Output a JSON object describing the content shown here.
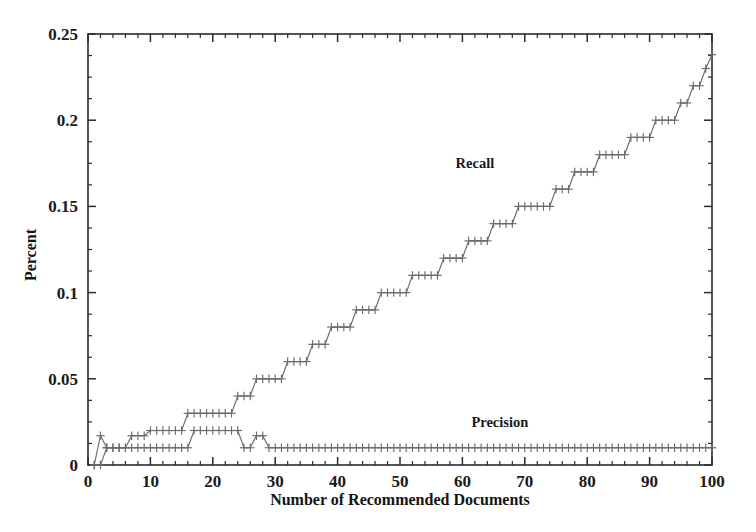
{
  "chart_data": {
    "type": "line",
    "title": "",
    "xlabel": "Number of Recommended Documents",
    "ylabel": "Percent",
    "xlim": [
      0,
      100
    ],
    "ylim": [
      0,
      0.25
    ],
    "xticks": [
      0,
      10,
      20,
      30,
      40,
      50,
      60,
      70,
      80,
      90,
      100
    ],
    "xticklabels": [
      "0",
      "10",
      "20",
      "30",
      "40",
      "50",
      "60",
      "70",
      "80",
      "90",
      "100"
    ],
    "yticks": [
      0,
      0.05,
      0.1,
      0.15,
      0.2,
      0.25
    ],
    "yticklabels": [
      "0",
      "0.05",
      "0.1",
      "0.15",
      "0.2",
      "0.25"
    ],
    "grid": false,
    "legend_position": "inline-annotations",
    "marker": "plus",
    "line_color": "#6a6a6a",
    "series": [
      {
        "name": "Recall",
        "label_x": 62,
        "label_y": 0.172,
        "x": [
          1,
          2,
          3,
          4,
          5,
          6,
          7,
          8,
          9,
          10,
          11,
          12,
          13,
          14,
          15,
          16,
          17,
          18,
          19,
          20,
          21,
          22,
          23,
          24,
          25,
          26,
          27,
          28,
          29,
          30,
          31,
          32,
          33,
          34,
          35,
          36,
          37,
          38,
          39,
          40,
          41,
          42,
          43,
          44,
          45,
          46,
          47,
          48,
          49,
          50,
          51,
          52,
          53,
          54,
          55,
          56,
          57,
          58,
          59,
          60,
          61,
          62,
          63,
          64,
          65,
          66,
          67,
          68,
          69,
          70,
          71,
          72,
          73,
          74,
          75,
          76,
          77,
          78,
          79,
          80,
          81,
          82,
          83,
          84,
          85,
          86,
          87,
          88,
          89,
          90,
          91,
          92,
          93,
          94,
          95,
          96,
          97,
          98,
          99,
          100
        ],
        "y": [
          0.0,
          0.017,
          0.01,
          0.01,
          0.01,
          0.01,
          0.017,
          0.017,
          0.017,
          0.02,
          0.02,
          0.02,
          0.02,
          0.02,
          0.02,
          0.03,
          0.03,
          0.03,
          0.03,
          0.03,
          0.03,
          0.03,
          0.03,
          0.04,
          0.04,
          0.04,
          0.05,
          0.05,
          0.05,
          0.05,
          0.05,
          0.06,
          0.06,
          0.06,
          0.06,
          0.07,
          0.07,
          0.07,
          0.08,
          0.08,
          0.08,
          0.08,
          0.09,
          0.09,
          0.09,
          0.09,
          0.1,
          0.1,
          0.1,
          0.1,
          0.1,
          0.11,
          0.11,
          0.11,
          0.11,
          0.11,
          0.12,
          0.12,
          0.12,
          0.12,
          0.13,
          0.13,
          0.13,
          0.13,
          0.14,
          0.14,
          0.14,
          0.14,
          0.15,
          0.15,
          0.15,
          0.15,
          0.15,
          0.15,
          0.16,
          0.16,
          0.16,
          0.17,
          0.17,
          0.17,
          0.17,
          0.18,
          0.18,
          0.18,
          0.18,
          0.18,
          0.19,
          0.19,
          0.19,
          0.19,
          0.2,
          0.2,
          0.2,
          0.2,
          0.21,
          0.21,
          0.22,
          0.22,
          0.23,
          0.238
        ]
      },
      {
        "name": "Precision",
        "label_x": 66,
        "label_y": 0.022,
        "x": [
          1,
          2,
          3,
          4,
          5,
          6,
          7,
          8,
          9,
          10,
          11,
          12,
          13,
          14,
          15,
          16,
          17,
          18,
          19,
          20,
          21,
          22,
          23,
          24,
          25,
          26,
          27,
          28,
          29,
          30,
          31,
          32,
          33,
          34,
          35,
          36,
          37,
          38,
          39,
          40,
          41,
          42,
          43,
          44,
          45,
          46,
          47,
          48,
          49,
          50,
          51,
          52,
          53,
          54,
          55,
          56,
          57,
          58,
          59,
          60,
          61,
          62,
          63,
          64,
          65,
          66,
          67,
          68,
          69,
          70,
          71,
          72,
          73,
          74,
          75,
          76,
          77,
          78,
          79,
          80,
          81,
          82,
          83,
          84,
          85,
          86,
          87,
          88,
          89,
          90,
          91,
          92,
          93,
          94,
          95,
          96,
          97,
          98,
          99,
          100
        ],
        "y": [
          0.0,
          0.0,
          0.01,
          0.01,
          0.01,
          0.01,
          0.01,
          0.01,
          0.01,
          0.01,
          0.01,
          0.01,
          0.01,
          0.01,
          0.01,
          0.01,
          0.02,
          0.02,
          0.02,
          0.02,
          0.02,
          0.02,
          0.02,
          0.02,
          0.01,
          0.01,
          0.017,
          0.017,
          0.01,
          0.01,
          0.01,
          0.01,
          0.01,
          0.01,
          0.01,
          0.01,
          0.01,
          0.01,
          0.01,
          0.01,
          0.01,
          0.01,
          0.01,
          0.01,
          0.01,
          0.01,
          0.01,
          0.01,
          0.01,
          0.01,
          0.01,
          0.01,
          0.01,
          0.01,
          0.01,
          0.01,
          0.01,
          0.01,
          0.01,
          0.01,
          0.01,
          0.01,
          0.01,
          0.01,
          0.01,
          0.01,
          0.01,
          0.01,
          0.01,
          0.01,
          0.01,
          0.01,
          0.01,
          0.01,
          0.01,
          0.01,
          0.01,
          0.01,
          0.01,
          0.01,
          0.01,
          0.01,
          0.01,
          0.01,
          0.01,
          0.01,
          0.01,
          0.01,
          0.01,
          0.01,
          0.01,
          0.01,
          0.01,
          0.01,
          0.01,
          0.01,
          0.01,
          0.01,
          0.01,
          0.01
        ]
      }
    ]
  }
}
